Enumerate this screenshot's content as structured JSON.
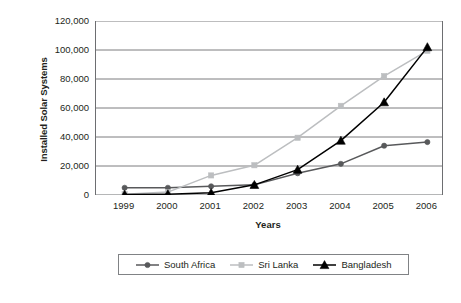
{
  "chart_data": {
    "type": "line",
    "title": "",
    "xlabel": "Years",
    "ylabel": "Installed Solar Systems",
    "categories": [
      "1999",
      "2000",
      "2001",
      "2002",
      "2003",
      "2004",
      "2005",
      "2006"
    ],
    "x": [
      1999,
      2000,
      2001,
      2002,
      2003,
      2004,
      2005,
      2006
    ],
    "ylim": [
      0,
      120000
    ],
    "ytick_labels": [
      "120,000",
      "100,000",
      "80,000",
      "60,000",
      "40,000",
      "20,000",
      "0"
    ],
    "ytick_values": [
      120000,
      100000,
      80000,
      60000,
      40000,
      20000,
      0
    ],
    "grid": true,
    "legend_position": "bottom",
    "series": [
      {
        "name": "South Africa",
        "color": "#58595b",
        "marker": "circle",
        "values": [
          5000,
          5000,
          6000,
          7000,
          15000,
          21500,
          34000,
          36500
        ]
      },
      {
        "name": "Sri Lanka",
        "color": "#bcbec0",
        "marker": "square",
        "values": [
          500,
          2000,
          13500,
          20500,
          39500,
          61500,
          82000,
          99500
        ]
      },
      {
        "name": "Bangladesh",
        "color": "#000000",
        "marker": "triangle",
        "values": [
          300,
          600,
          1500,
          7000,
          17500,
          37500,
          64000,
          102000
        ]
      }
    ]
  },
  "legend": {
    "entries": [
      {
        "label": "South Africa"
      },
      {
        "label": "Sri Lanka"
      },
      {
        "label": "Bangladesh"
      }
    ]
  },
  "colors": {
    "south_africa": "#58595b",
    "sri_lanka": "#bcbec0",
    "bangladesh": "#000000",
    "axis": "#6d6e71",
    "grid": "#6d6e71",
    "text": "#231f20"
  }
}
